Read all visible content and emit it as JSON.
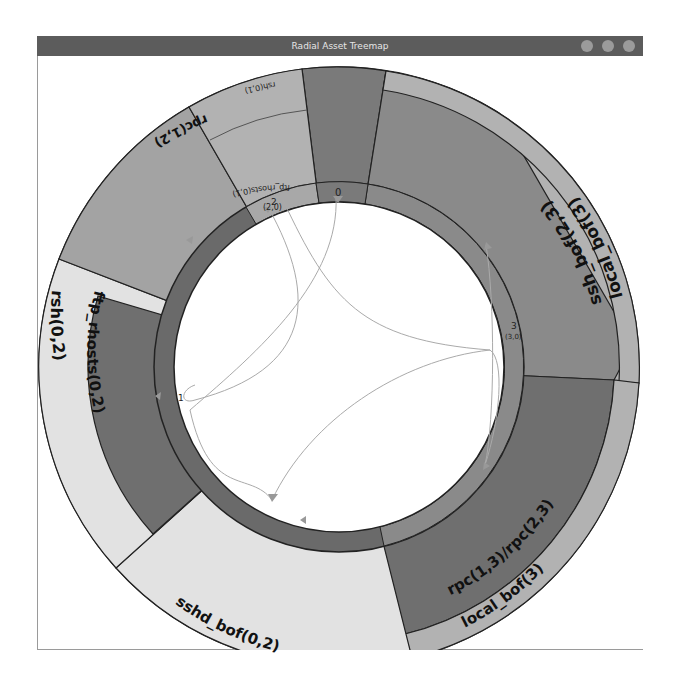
{
  "window": {
    "title": "Radial Asset Treemap",
    "controls": [
      "minimize",
      "maximize",
      "close"
    ]
  },
  "diagram": {
    "type": "radial-treemap",
    "center": [
      339,
      367
    ],
    "segments": [
      {
        "label": "ssh_bof(2,3)",
        "inner_label": "",
        "start": 9,
        "end": 93,
        "layer": "inner",
        "color": "#8a8a8a"
      },
      {
        "label": "local_bof(3)",
        "start": 9,
        "end": 93,
        "layer": "outer",
        "color": "#b2b2b2"
      },
      {
        "label": "rpc(1,3)/rpc(2,3)",
        "start": 93,
        "end": 166,
        "layer": "inner",
        "color": "#6f6f6f"
      },
      {
        "label": "local_bof(3)",
        "start": 93,
        "end": 166,
        "layer": "outer",
        "color": "#b2b2b2"
      },
      {
        "label": "sshd_bof(0,2)",
        "start": 166,
        "end": 228,
        "layer": "full",
        "color": "#e2e2e2"
      },
      {
        "label": "ftp_rhosts(0,2)",
        "start": 228,
        "end": 291,
        "layer": "inner",
        "color": "#6f6f6f"
      },
      {
        "label": "rsh(0,2)",
        "start": 228,
        "end": 291,
        "layer": "outer",
        "color": "#e2e2e2"
      },
      {
        "label": "rpc(1,2)",
        "start": 291,
        "end": 330,
        "layer": "full",
        "color": "#a3a3a3"
      },
      {
        "label": "ftp_rhosts(0,1)",
        "start": 330,
        "end": 353,
        "layer": "inner",
        "color": "#b2b2b2"
      },
      {
        "label": "rsh(0,1)",
        "start": 330,
        "end": 353,
        "layer": "outer",
        "color": "#b2b2b2"
      },
      {
        "label": "",
        "start": 353,
        "end": 369,
        "layer": "full",
        "color": "#7a7a7a"
      }
    ],
    "host_ring": [
      {
        "id": "0",
        "sublabel": "",
        "start": 353,
        "end": 369,
        "color": "#7a7a7a"
      },
      {
        "id": "2",
        "sublabel": "(2,0)",
        "start": 330,
        "end": 353,
        "color": "#a8a8a8"
      },
      {
        "id": "3",
        "sublabel": "(3,0)",
        "start": 9,
        "end": 166,
        "color": "#8a8a8a"
      },
      {
        "id": "1",
        "sublabel": "",
        "start": 166,
        "end": 330,
        "color": "#6a6a6a"
      }
    ],
    "host_labels": {
      "h0": "0",
      "h2": "2",
      "h2_sub": "(2,0)",
      "h3": "3",
      "h3_sub": "(3,0)",
      "h1": "1"
    },
    "labels": {
      "ssh_bof": "ssh_bof(2,3)",
      "local_bof_top": "local_bof(3)",
      "rpc_rpc": "rpc(1,3)/rpc(2,3)",
      "local_bof_bottom": "local_bof(3)",
      "sshd_bof": "sshd_bof(0,2)",
      "ftp_rhosts_02": "ftp_rhosts(0,2)",
      "rsh_02": "rsh(0,2)",
      "rpc_12": "rpc(1,2)",
      "ftp_rhosts_01": "ftp_rhosts(0,1)",
      "rsh_01": "rsh(0,1)"
    }
  }
}
